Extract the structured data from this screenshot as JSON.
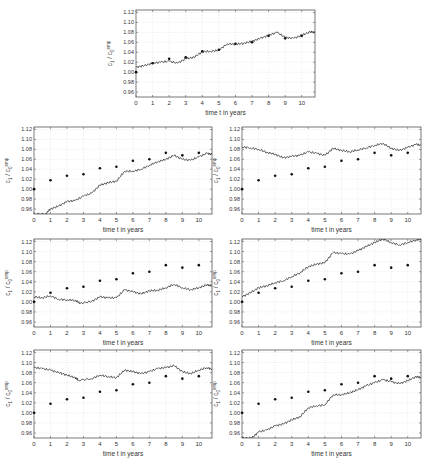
{
  "chart_data": [
    {
      "id": "top",
      "type": "line",
      "title": "",
      "xlabel": "time t in years",
      "ylabel": "c_1 / c_0^emp",
      "xlim": [
        0,
        10.8
      ],
      "ylim": [
        0.95,
        1.125
      ],
      "xticks": [
        0,
        1,
        2,
        3,
        4,
        5,
        6,
        7,
        8,
        9,
        10
      ],
      "yticks": [
        0.96,
        0.98,
        1.0,
        1.02,
        1.04,
        1.06,
        1.08,
        1.1,
        1.12
      ],
      "ytick_labels": [
        "0.96",
        "0.98",
        "1.00",
        "1.02",
        "1.04",
        "1.06",
        "1.08",
        "1.10",
        "1.12"
      ],
      "grid": true,
      "series": [
        {
          "name": "simulated path",
          "style": "line",
          "x": [
            0,
            0.5,
            1,
            1.5,
            2,
            2.5,
            3,
            3.5,
            4,
            4.5,
            5,
            5.5,
            6,
            6.5,
            7,
            7.5,
            8,
            8.5,
            9,
            9.5,
            10,
            10.5,
            10.8
          ],
          "values": [
            1.01,
            1.013,
            1.018,
            1.02,
            1.022,
            1.018,
            1.027,
            1.03,
            1.041,
            1.042,
            1.044,
            1.057,
            1.056,
            1.058,
            1.062,
            1.068,
            1.074,
            1.08,
            1.07,
            1.068,
            1.074,
            1.081,
            1.08
          ]
        },
        {
          "name": "empirical",
          "style": "markers",
          "x": [
            0,
            1,
            2,
            3,
            4,
            5,
            6,
            7,
            8,
            9,
            10
          ],
          "values": [
            1.0,
            1.018,
            1.027,
            1.03,
            1.042,
            1.045,
            1.057,
            1.06,
            1.073,
            1.068,
            1.073
          ]
        }
      ]
    },
    {
      "id": "row1-left",
      "type": "line",
      "xlabel": "time t in years",
      "ylabel": "c_1 / c_0^emp",
      "xlim": [
        0,
        10.8
      ],
      "ylim": [
        0.95,
        1.125
      ],
      "grid": true,
      "series": [
        {
          "name": "simulated path",
          "style": "line",
          "x": [
            0,
            0.7,
            1,
            1.5,
            2,
            2.5,
            3,
            3.5,
            4,
            4.5,
            5,
            5.5,
            6,
            6.5,
            7,
            7.5,
            8,
            8.5,
            9,
            9.5,
            10,
            10.5,
            10.8
          ],
          "values": [
            0.95,
            0.95,
            0.96,
            0.966,
            0.975,
            0.977,
            0.986,
            0.992,
            1.008,
            1.013,
            1.016,
            1.036,
            1.036,
            1.04,
            1.048,
            1.055,
            1.06,
            1.068,
            1.06,
            1.058,
            1.065,
            1.072,
            1.07
          ]
        },
        {
          "name": "empirical",
          "style": "markers",
          "x": [
            0,
            1,
            2,
            3,
            4,
            5,
            6,
            7,
            8,
            9,
            10
          ],
          "values": [
            1.0,
            1.018,
            1.027,
            1.03,
            1.042,
            1.045,
            1.057,
            1.06,
            1.073,
            1.068,
            1.073
          ]
        }
      ]
    },
    {
      "id": "row1-right",
      "type": "line",
      "xlabel": "time t in years",
      "ylabel": "c_1 / c_0^emp",
      "xlim": [
        0,
        10.8
      ],
      "ylim": [
        0.95,
        1.125
      ],
      "grid": true,
      "series": [
        {
          "name": "simulated path",
          "style": "line",
          "x": [
            0,
            0.5,
            1,
            1.5,
            2,
            2.5,
            3,
            3.5,
            4,
            4.5,
            5,
            5.5,
            6,
            6.5,
            7,
            7.5,
            8,
            8.5,
            9,
            9.5,
            10,
            10.5,
            10.8
          ],
          "values": [
            1.085,
            1.083,
            1.08,
            1.074,
            1.07,
            1.063,
            1.066,
            1.068,
            1.075,
            1.072,
            1.068,
            1.082,
            1.078,
            1.075,
            1.079,
            1.083,
            1.088,
            1.092,
            1.082,
            1.078,
            1.084,
            1.09,
            1.088
          ]
        },
        {
          "name": "empirical",
          "style": "markers",
          "x": [
            0,
            1,
            2,
            3,
            4,
            5,
            6,
            7,
            8,
            9,
            10
          ],
          "values": [
            1.0,
            1.018,
            1.027,
            1.03,
            1.042,
            1.045,
            1.057,
            1.06,
            1.073,
            1.068,
            1.073
          ]
        }
      ]
    },
    {
      "id": "row2-left",
      "type": "line",
      "xlabel": "time t in years",
      "ylabel": "c_1 / c_0^emp",
      "xlim": [
        0,
        10.8
      ],
      "ylim": [
        0.95,
        1.125
      ],
      "grid": true,
      "series": [
        {
          "name": "simulated path",
          "style": "line",
          "x": [
            0,
            0.5,
            1,
            1.5,
            2,
            2.5,
            2.8,
            3.5,
            4,
            4.5,
            5,
            5.5,
            6,
            6.5,
            7,
            7.5,
            8,
            8.5,
            9,
            9.5,
            10,
            10.5,
            10.8
          ],
          "values": [
            1.01,
            1.008,
            1.012,
            1.005,
            1.004,
            1.003,
            0.997,
            1.001,
            1.01,
            1.008,
            1.008,
            1.024,
            1.02,
            1.016,
            1.022,
            1.023,
            1.028,
            1.035,
            1.028,
            1.024,
            1.028,
            1.034,
            1.032
          ]
        },
        {
          "name": "empirical",
          "style": "markers",
          "x": [
            0,
            1,
            2,
            3,
            4,
            5,
            6,
            7,
            8,
            9,
            10
          ],
          "values": [
            1.0,
            1.018,
            1.027,
            1.03,
            1.042,
            1.045,
            1.057,
            1.06,
            1.073,
            1.068,
            1.073
          ]
        }
      ]
    },
    {
      "id": "row2-right",
      "type": "line",
      "xlabel": "time t in years",
      "ylabel": "c_1 / c_0^emp",
      "xlim": [
        0,
        10.8
      ],
      "ylim": [
        0.95,
        1.125
      ],
      "grid": true,
      "series": [
        {
          "name": "simulated path",
          "style": "line",
          "x": [
            0,
            0.5,
            1,
            1.5,
            2,
            2.5,
            3,
            3.5,
            4,
            4.5,
            5,
            5.5,
            6,
            6.5,
            7,
            7.5,
            8,
            8.5,
            9,
            9.5,
            10,
            10.5,
            10.8
          ],
          "values": [
            1.01,
            1.018,
            1.028,
            1.032,
            1.038,
            1.042,
            1.05,
            1.058,
            1.07,
            1.075,
            1.078,
            1.098,
            1.096,
            1.095,
            1.102,
            1.11,
            1.118,
            1.125,
            1.118,
            1.113,
            1.118,
            1.123,
            1.125
          ]
        },
        {
          "name": "empirical",
          "style": "markers",
          "x": [
            0,
            1,
            2,
            3,
            4,
            5,
            6,
            7,
            8,
            9,
            10
          ],
          "values": [
            1.0,
            1.018,
            1.027,
            1.03,
            1.042,
            1.045,
            1.057,
            1.06,
            1.073,
            1.068,
            1.073
          ]
        }
      ]
    },
    {
      "id": "row3-left",
      "type": "line",
      "xlabel": "time t in years",
      "ylabel": "c_1 / c_0^emp",
      "xlim": [
        0,
        10.8
      ],
      "ylim": [
        0.95,
        1.125
      ],
      "grid": true,
      "series": [
        {
          "name": "simulated path",
          "style": "line",
          "x": [
            0,
            0.5,
            1,
            1.5,
            2,
            2.5,
            2.7,
            3.5,
            4,
            4.5,
            5,
            5.5,
            6,
            6.5,
            7,
            7.5,
            8,
            8.5,
            9,
            9.5,
            10,
            10.5,
            10.8
          ],
          "values": [
            1.09,
            1.088,
            1.085,
            1.08,
            1.075,
            1.07,
            1.065,
            1.068,
            1.075,
            1.072,
            1.07,
            1.085,
            1.082,
            1.078,
            1.082,
            1.088,
            1.09,
            1.094,
            1.082,
            1.078,
            1.085,
            1.09,
            1.087
          ]
        },
        {
          "name": "empirical",
          "style": "markers",
          "x": [
            0,
            1,
            2,
            3,
            4,
            5,
            6,
            7,
            8,
            9,
            10
          ],
          "values": [
            1.0,
            1.018,
            1.027,
            1.03,
            1.042,
            1.045,
            1.057,
            1.06,
            1.073,
            1.068,
            1.073
          ]
        }
      ]
    },
    {
      "id": "row3-right",
      "type": "line",
      "xlabel": "time t in years",
      "ylabel": "c_1 / c_0^emp",
      "xlim": [
        0,
        10.8
      ],
      "ylim": [
        0.95,
        1.125
      ],
      "grid": true,
      "series": [
        {
          "name": "simulated path",
          "style": "line",
          "x": [
            0,
            0.6,
            1,
            1.5,
            2,
            2.5,
            3,
            3.5,
            4,
            4.5,
            5,
            5.5,
            6,
            6.5,
            7,
            7.5,
            8,
            8.5,
            9,
            9.5,
            10,
            10.5,
            10.8
          ],
          "values": [
            0.95,
            0.95,
            0.962,
            0.966,
            0.974,
            0.978,
            0.986,
            0.992,
            1.01,
            1.014,
            1.016,
            1.036,
            1.036,
            1.04,
            1.046,
            1.054,
            1.06,
            1.066,
            1.062,
            1.058,
            1.064,
            1.072,
            1.07
          ]
        },
        {
          "name": "empirical",
          "style": "markers",
          "x": [
            0,
            1,
            2,
            3,
            4,
            5,
            6,
            7,
            8,
            9,
            10
          ],
          "values": [
            1.0,
            1.018,
            1.027,
            1.03,
            1.042,
            1.045,
            1.057,
            1.06,
            1.073,
            1.068,
            1.073
          ]
        }
      ]
    }
  ],
  "layout": {
    "panels": [
      {
        "id": "top",
        "left": 136,
        "top": 10,
        "width": 179,
        "height": 87
      },
      {
        "id": "row1-left",
        "left": 34,
        "top": 127,
        "width": 178,
        "height": 87
      },
      {
        "id": "row1-right",
        "left": 242,
        "top": 127,
        "width": 179,
        "height": 87
      },
      {
        "id": "row2-left",
        "left": 34,
        "top": 239,
        "width": 178,
        "height": 88
      },
      {
        "id": "row2-right",
        "left": 242,
        "top": 239,
        "width": 179,
        "height": 88
      },
      {
        "id": "row3-left",
        "left": 34,
        "top": 350,
        "width": 178,
        "height": 88
      },
      {
        "id": "row3-right",
        "left": 242,
        "top": 350,
        "width": 179,
        "height": 88
      }
    ]
  },
  "labels": {
    "xlabel": "time t in years",
    "ylabel_main": "c",
    "ylabel_sub1": "1",
    "ylabel_slash": " / c",
    "ylabel_sub0": "0",
    "ylabel_sup": "emp"
  }
}
